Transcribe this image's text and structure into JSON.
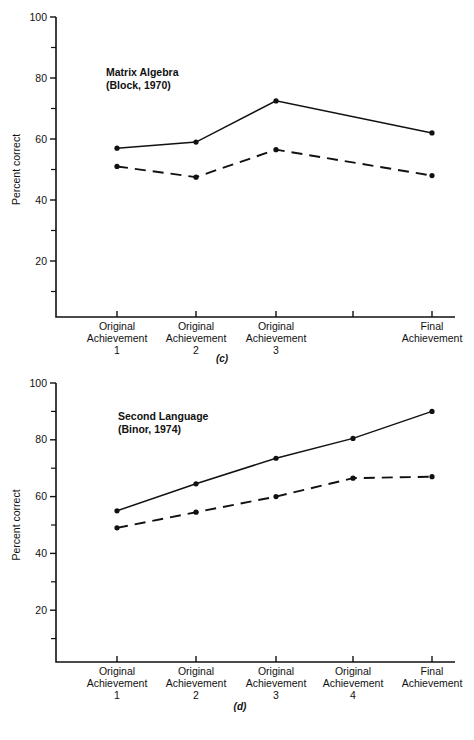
{
  "document": {
    "background_color": "#ffffff",
    "ink_color": "#111111"
  },
  "chart_data": [
    {
      "id": "panel-c",
      "type": "line",
      "title": "Matrix Algebra",
      "subtitle": "(Block, 1970)",
      "caption": "(c)",
      "xlabel": "",
      "ylabel": "Percent correct",
      "ylim": [
        0,
        100
      ],
      "ytick_major": [
        20,
        40,
        60,
        80,
        100
      ],
      "ytick_minor": [
        10,
        30,
        50,
        70,
        90
      ],
      "grid": false,
      "legend": "none",
      "categories": [
        "Original Achievement 1",
        "Original Achievement 2",
        "Original Achievement 3",
        "",
        "Final Achievement"
      ],
      "category_lines": [
        [
          "Original",
          "Achievement",
          "1"
        ],
        [
          "Original",
          "Achievement",
          "2"
        ],
        [
          "Original",
          "Achievement",
          "3"
        ],
        [
          "",
          "",
          ""
        ],
        [
          "Final",
          "Achievement",
          ""
        ]
      ],
      "series": [
        {
          "name": "solid",
          "style": "solid",
          "x_index": [
            0,
            1,
            2,
            4
          ],
          "values": [
            57,
            59,
            72.5,
            62
          ]
        },
        {
          "name": "dashed",
          "style": "dashed",
          "x_index": [
            0,
            1,
            2,
            4
          ],
          "values": [
            51,
            47.5,
            56.5,
            48
          ]
        }
      ]
    },
    {
      "id": "panel-d",
      "type": "line",
      "title": "Second Language",
      "subtitle": "(Binor, 1974)",
      "caption": "(d)",
      "xlabel": "",
      "ylabel": "Percent correct",
      "ylim": [
        0,
        100
      ],
      "ytick_major": [
        20,
        40,
        60,
        80,
        100
      ],
      "ytick_minor": [
        10,
        30,
        50,
        70,
        90
      ],
      "grid": false,
      "legend": "none",
      "categories": [
        "Original Achievement 1",
        "Original Achievement 2",
        "Original Achievement 3",
        "Original Achievement 4",
        "Final Achievement"
      ],
      "category_lines": [
        [
          "Original",
          "Achievement",
          "1"
        ],
        [
          "Original",
          "Achievement",
          "2"
        ],
        [
          "Original",
          "Achievement",
          "3"
        ],
        [
          "Original",
          "Achievement",
          "4"
        ],
        [
          "Final",
          "Achievement",
          ""
        ]
      ],
      "series": [
        {
          "name": "solid",
          "style": "solid",
          "x_index": [
            0,
            1,
            2,
            3,
            4
          ],
          "values": [
            55,
            64.5,
            73.5,
            80.5,
            90
          ]
        },
        {
          "name": "dashed",
          "style": "dashed",
          "x_index": [
            0,
            1,
            2,
            3,
            4
          ],
          "values": [
            49,
            54.5,
            60,
            66.5,
            67
          ]
        }
      ]
    }
  ]
}
